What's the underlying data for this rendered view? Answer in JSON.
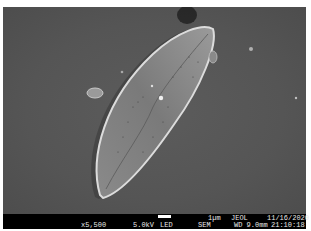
{
  "image": {
    "subject": "diatom frustule (SEM micrograph)",
    "background_color": "#575757"
  },
  "data_bar": {
    "magnification": "x5,500",
    "accelerating_voltage": "5.0kV",
    "detector": "LED",
    "mode": "SEM",
    "scale_label": "1µm",
    "working_distance": "WD 9.0mm",
    "manufacturer": "JEOL",
    "date": "11/16/2020",
    "time": "21:10:18"
  }
}
